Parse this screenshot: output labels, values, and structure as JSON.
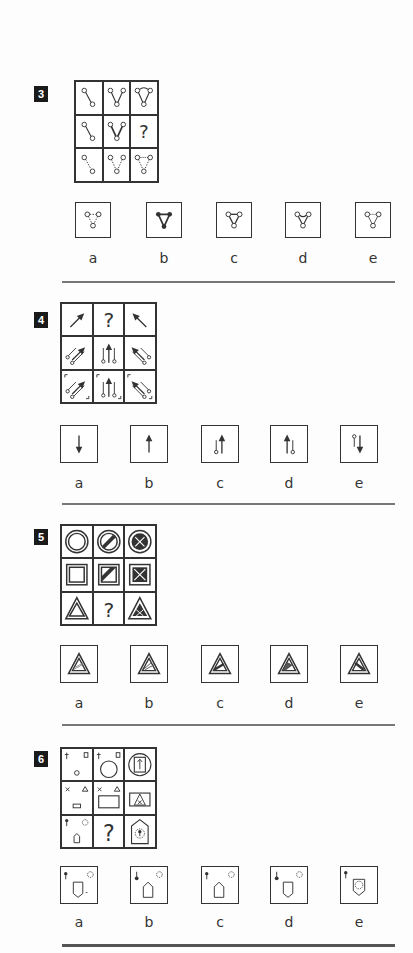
{
  "questions": [
    {
      "number": "3",
      "options": [
        "a",
        "b",
        "c",
        "d",
        "e"
      ],
      "missing": "?"
    },
    {
      "number": "4",
      "options": [
        "a",
        "b",
        "c",
        "d",
        "e"
      ],
      "missing": "?"
    },
    {
      "number": "5",
      "options": [
        "a",
        "b",
        "c",
        "d",
        "e"
      ],
      "missing": "?"
    },
    {
      "number": "6",
      "options": [
        "a",
        "b",
        "c",
        "d",
        "e"
      ],
      "missing": "?"
    }
  ],
  "colors": {
    "ink": "#333333",
    "badge": "#1a1a1a",
    "divider": "#777777"
  }
}
